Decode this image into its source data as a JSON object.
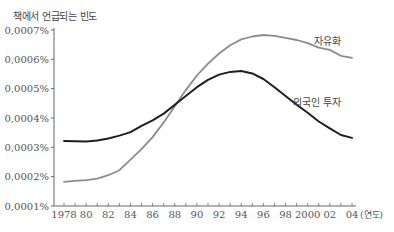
{
  "chart_data": {
    "type": "line",
    "title": "",
    "ylabel": "책에서 언급되는 빈도",
    "xlabel": "(연도)",
    "ylim": [
      0.0001,
      0.0007
    ],
    "xlim": [
      1978,
      2004
    ],
    "grid": false,
    "y_ticks": [
      "0,0001%",
      "0,0002%",
      "0,0003%",
      "0,0004%",
      "0,0005%",
      "0,0006%",
      "0,0007%"
    ],
    "y_tick_values": [
      0.0001,
      0.0002,
      0.0003,
      0.0004,
      0.0005,
      0.0006,
      0.0007
    ],
    "x_ticks": [
      "1978",
      "80",
      "82",
      "84",
      "86",
      "88",
      "90",
      "92",
      "94",
      "96",
      "98",
      "2000",
      "02",
      "04"
    ],
    "x_tick_values": [
      1978,
      1980,
      1982,
      1984,
      1986,
      1988,
      1990,
      1992,
      1994,
      1996,
      1998,
      2000,
      2002,
      2004
    ],
    "x": [
      1978,
      1979,
      1980,
      1981,
      1982,
      1983,
      1984,
      1985,
      1986,
      1987,
      1988,
      1989,
      1990,
      1991,
      1992,
      1993,
      1994,
      1995,
      1996,
      1997,
      1998,
      1999,
      2000,
      2001,
      2002,
      2003,
      2004
    ],
    "series": [
      {
        "name": "자유화",
        "color": "#8c8c8c",
        "values": [
          0.000182,
          0.000186,
          0.000188,
          0.000193,
          0.000205,
          0.000222,
          0.000258,
          0.000294,
          0.000335,
          0.000385,
          0.00044,
          0.000495,
          0.000545,
          0.000585,
          0.00062,
          0.000648,
          0.000668,
          0.000678,
          0.000683,
          0.00068,
          0.000673,
          0.000666,
          0.000655,
          0.00064,
          0.000632,
          0.000612,
          0.000605
        ]
      },
      {
        "name": "외국인 투자",
        "color": "#1e1e1e",
        "values": [
          0.000322,
          0.000321,
          0.00032,
          0.000323,
          0.00033,
          0.00034,
          0.000352,
          0.000373,
          0.000392,
          0.000415,
          0.000445,
          0.000475,
          0.000505,
          0.00053,
          0.000548,
          0.000557,
          0.00056,
          0.000552,
          0.000533,
          0.000505,
          0.000475,
          0.000445,
          0.000418,
          0.000388,
          0.000365,
          0.000342,
          0.000332
        ]
      }
    ],
    "annotations": [
      {
        "text": "자유화",
        "x": 2002,
        "y": 0.00066
      },
      {
        "text": "외국인 투자",
        "x": 2002,
        "y": 0.00045
      }
    ],
    "legend_position": "inline labels"
  }
}
